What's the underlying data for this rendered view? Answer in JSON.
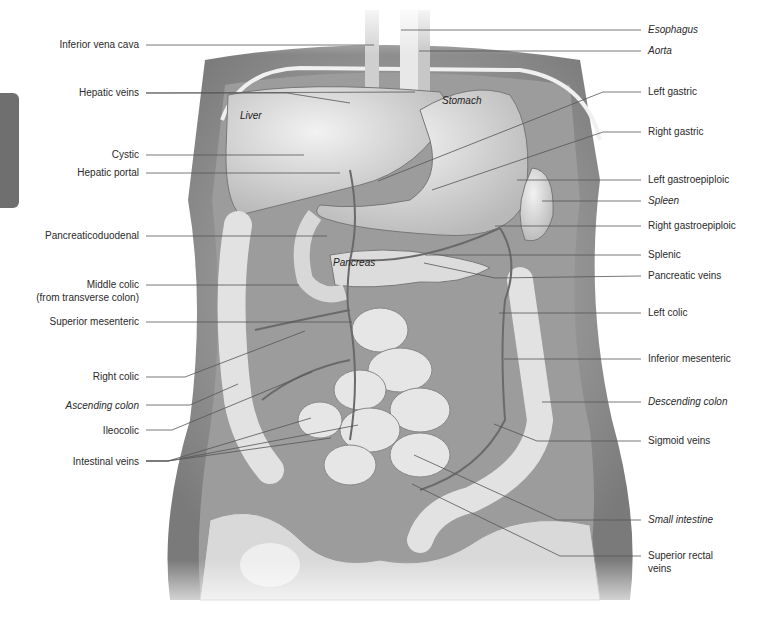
{
  "figure": {
    "side_tab_color": "#6f6f6f",
    "organ_labels": {
      "liver": "Liver",
      "stomach": "Stomach",
      "pancreas": "Pancreas"
    },
    "left_labels": [
      {
        "text": "Inferior vena cava",
        "italic": false
      },
      {
        "text": "Hepatic veins",
        "italic": false
      },
      {
        "text": "Cystic",
        "italic": false
      },
      {
        "text": "Hepatic portal",
        "italic": false
      },
      {
        "text": "Pancreaticoduodenal",
        "italic": false
      },
      {
        "text": "Middle colic",
        "italic": false
      },
      {
        "text": "(from transverse colon)",
        "italic": false
      },
      {
        "text": "Superior mesenteric",
        "italic": false
      },
      {
        "text": "Right colic",
        "italic": false
      },
      {
        "text": "Ascending colon",
        "italic": true
      },
      {
        "text": "Ileocolic",
        "italic": false
      },
      {
        "text": "Intestinal veins",
        "italic": false
      }
    ],
    "right_labels": [
      {
        "text": "Esophagus",
        "italic": true
      },
      {
        "text": "Aorta",
        "italic": true
      },
      {
        "text": "Left gastric",
        "italic": false
      },
      {
        "text": "Right gastric",
        "italic": false
      },
      {
        "text": "Left gastroepiploic",
        "italic": false
      },
      {
        "text": "Spleen",
        "italic": true
      },
      {
        "text": "Right gastroepiploic",
        "italic": false
      },
      {
        "text": "Splenic",
        "italic": false
      },
      {
        "text": "Pancreatic veins",
        "italic": false
      },
      {
        "text": "Left colic",
        "italic": false
      },
      {
        "text": "Inferior mesenteric",
        "italic": false
      },
      {
        "text": "Descending colon",
        "italic": true
      },
      {
        "text": "Sigmoid veins",
        "italic": false
      },
      {
        "text": "Small intestine",
        "italic": true
      },
      {
        "text": "Superior rectal",
        "italic": false
      },
      {
        "text": "veins",
        "italic": false
      }
    ]
  }
}
